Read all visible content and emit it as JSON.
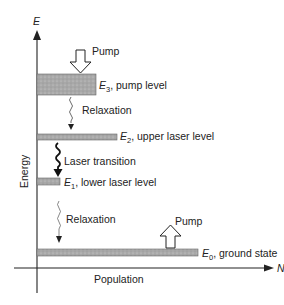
{
  "diagram": {
    "type": "energy-level diagram (four-level laser)",
    "axes": {
      "y_symbol": "E",
      "y_label": "Energy",
      "x_symbol": "N",
      "x_label": "Population"
    },
    "levels": [
      {
        "id": "E3",
        "symbol": "E",
        "sub": "3",
        "desc": ", pump level"
      },
      {
        "id": "E2",
        "symbol": "E",
        "sub": "2",
        "desc": ", upper laser level"
      },
      {
        "id": "E1",
        "symbol": "E",
        "sub": "1",
        "desc": ", lower laser level"
      },
      {
        "id": "E0",
        "symbol": "E",
        "sub": "0",
        "desc": ", ground state"
      }
    ],
    "transitions": [
      {
        "label": "Pump",
        "direction": "down-into-E3",
        "style": "hollow-arrow"
      },
      {
        "label": "Relaxation",
        "from": "E3",
        "to": "E2",
        "style": "thin-wavy"
      },
      {
        "label": "Laser transition",
        "from": "E2",
        "to": "E1",
        "style": "bold-wavy"
      },
      {
        "label": "Relaxation",
        "from": "E1",
        "to": "E0",
        "style": "thin-wavy"
      },
      {
        "label": "Pump",
        "direction": "up-from-E0",
        "style": "hollow-arrow"
      }
    ],
    "colors": {
      "bar_fill": "#a9a9a9",
      "bar_stroke": "#555555",
      "line": "#222222"
    }
  }
}
